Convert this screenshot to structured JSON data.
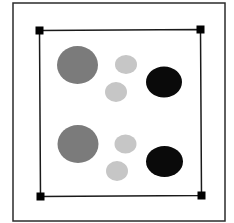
{
  "diagram": {
    "background": "#ffffff",
    "outer_frame": {
      "x": 13,
      "y": 3,
      "width": 212,
      "height": 218,
      "stroke": "#2b2b2b",
      "stroke_width": 1.5
    },
    "selection_box": {
      "corners": [
        [
          39.5,
          30.5
        ],
        [
          200.5,
          29.5
        ],
        [
          201.5,
          195.5
        ],
        [
          40.5,
          196.5
        ]
      ],
      "stroke": "#1a1a1a",
      "stroke_width": 1.5,
      "handle_size": 8,
      "handle_color": "#000000",
      "handles": [
        {
          "name": "top-left",
          "x": 39.5,
          "y": 30.5
        },
        {
          "name": "top-right",
          "x": 200.5,
          "y": 29.5
        },
        {
          "name": "bottom-right",
          "x": 201.5,
          "y": 195.5
        },
        {
          "name": "bottom-left",
          "x": 40.5,
          "y": 196.5
        }
      ]
    },
    "colors": {
      "large": "#7b7b7b",
      "small": "#c6c6c6",
      "dark": "#0a0a0a"
    },
    "groups": [
      {
        "name": "top-group",
        "shapes": [
          {
            "name": "large-gray-circle",
            "cx": 77.5,
            "cy": 65,
            "rx": 20.5,
            "ry": 19,
            "color": "large"
          },
          {
            "name": "small-light-circle-upper",
            "cx": 126,
            "cy": 64.5,
            "rx": 11,
            "ry": 9.5,
            "color": "small"
          },
          {
            "name": "small-light-circle-lower",
            "cx": 116,
            "cy": 92,
            "rx": 11,
            "ry": 10,
            "color": "small"
          },
          {
            "name": "black-ellipse",
            "cx": 164,
            "cy": 82,
            "rx": 18,
            "ry": 15.5,
            "color": "dark"
          }
        ]
      },
      {
        "name": "bottom-group",
        "shapes": [
          {
            "name": "large-gray-circle",
            "cx": 78,
            "cy": 144,
            "rx": 20.5,
            "ry": 19,
            "color": "large"
          },
          {
            "name": "small-light-circle-upper",
            "cx": 125.5,
            "cy": 144,
            "rx": 11,
            "ry": 9.5,
            "color": "small"
          },
          {
            "name": "small-light-circle-lower",
            "cx": 117,
            "cy": 171,
            "rx": 11,
            "ry": 10,
            "color": "small"
          },
          {
            "name": "black-ellipse",
            "cx": 164.5,
            "cy": 161.5,
            "rx": 18.5,
            "ry": 15.5,
            "color": "dark"
          }
        ]
      }
    ]
  }
}
